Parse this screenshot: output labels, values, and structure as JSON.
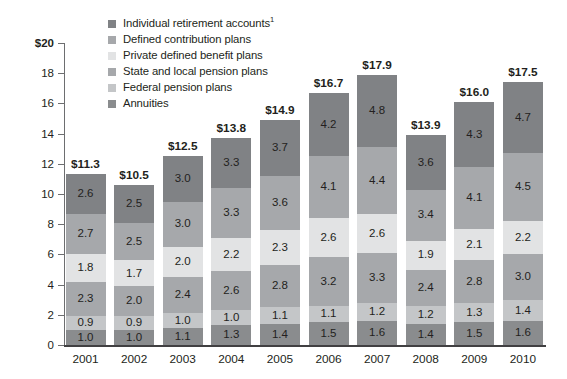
{
  "chart_data": {
    "type": "bar",
    "subtype": "stacked-bar",
    "title": "",
    "subtitle": "",
    "xlabel": "",
    "ylabel": "",
    "ylim": [
      0,
      20
    ],
    "y_ticks": [
      0,
      2,
      4,
      6,
      8,
      10,
      12,
      14,
      16,
      18,
      20
    ],
    "y_tick_labels": [
      "0",
      "2",
      "4",
      "6",
      "8",
      "10",
      "12",
      "14",
      "16",
      "18",
      "$20"
    ],
    "grid": false,
    "legend_position": "top-left",
    "units": "trillions of dollars",
    "categories": [
      "2001",
      "2002",
      "2003",
      "2004",
      "2005",
      "2006",
      "2007",
      "2008",
      "2009",
      "2010"
    ],
    "series": [
      {
        "name": "Annuities",
        "color": "#8a8c8e",
        "values": [
          1.0,
          1.0,
          1.1,
          1.3,
          1.4,
          1.5,
          1.6,
          1.4,
          1.5,
          1.6
        ]
      },
      {
        "name": "Federal pension plans",
        "color": "#c4c6c8",
        "values": [
          0.9,
          0.9,
          1.0,
          1.0,
          1.1,
          1.1,
          1.2,
          1.2,
          1.3,
          1.4
        ]
      },
      {
        "name": "State and local pension plans",
        "color": "#a6a8ab",
        "values": [
          2.3,
          2.0,
          2.4,
          2.6,
          2.8,
          3.2,
          3.3,
          2.4,
          2.8,
          3.0
        ]
      },
      {
        "name": "Private defined benefit plans",
        "color": "#e2e3e4",
        "values": [
          1.8,
          1.7,
          2.0,
          2.2,
          2.3,
          2.6,
          2.6,
          1.9,
          2.1,
          2.2
        ]
      },
      {
        "name": "Defined contribution plans",
        "color": "#a6a8ab",
        "values": [
          2.7,
          2.5,
          3.0,
          3.3,
          3.6,
          4.1,
          4.4,
          3.4,
          4.1,
          4.5
        ]
      },
      {
        "name": "Individual retirement accounts",
        "color": "#808285",
        "values": [
          2.6,
          2.5,
          3.0,
          3.3,
          3.7,
          4.2,
          4.8,
          3.6,
          4.3,
          4.7
        ]
      }
    ],
    "totals": [
      "$11.3",
      "$10.5",
      "$12.5",
      "$13.8",
      "$14.9",
      "$16.7",
      "$17.9",
      "$13.9",
      "$16.0",
      "$17.5"
    ],
    "total_values": [
      11.3,
      10.5,
      12.5,
      13.8,
      14.9,
      16.7,
      17.9,
      13.9,
      16.0,
      17.5
    ]
  },
  "legend": {
    "items": [
      {
        "label": "Individual retirement accounts",
        "superscript": "1",
        "color": "#808285"
      },
      {
        "label": "Defined contribution plans",
        "superscript": "",
        "color": "#a6a8ab"
      },
      {
        "label": "Private defined benefit plans",
        "superscript": "",
        "color": "#e2e3e4"
      },
      {
        "label": "State and local pension plans",
        "superscript": "",
        "color": "#a6a8ab"
      },
      {
        "label": "Federal pension plans",
        "superscript": "",
        "color": "#c4c6c8"
      },
      {
        "label": "Annuities",
        "superscript": "",
        "color": "#8a8c8e"
      }
    ]
  },
  "colors": {
    "axis": "#6d6e70",
    "axis_baseline": "#414042",
    "text": "#231f20",
    "background": "#ffffff"
  }
}
